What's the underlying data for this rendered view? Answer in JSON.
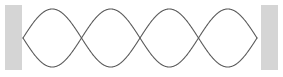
{
  "figure": {
    "name": "standing-wave-on-string-diagram",
    "width": 283,
    "height": 77,
    "background_color": "#ffffff"
  },
  "chart_data": {
    "type": "line",
    "title": "",
    "subtitle": "",
    "xlabel": "",
    "ylabel": "",
    "xlim": [
      23,
      257
    ],
    "ylim": [
      9,
      67
    ],
    "grid": false,
    "legend": false,
    "legend_position": "none",
    "harmonic_number": 4,
    "loops": 4,
    "interior_nodes": 3,
    "total_nodes": 5,
    "antinodes": 4,
    "axis_y": 38,
    "amplitude": 29,
    "string_left_x": 23,
    "string_right_x": 257,
    "wavelengths": 2,
    "node_x_positions": [
      23,
      81.5,
      140,
      198.5,
      257
    ],
    "antinode_x_positions": [
      52.25,
      110.75,
      169.25,
      227.75
    ],
    "series": [
      {
        "name": "envelope-upper",
        "phase": "positive",
        "stroke_color": "#5b5b5b",
        "stroke_width": 1.1
      },
      {
        "name": "envelope-lower",
        "phase": "negative",
        "stroke_color": "#5b5b5b",
        "stroke_width": 1.1
      }
    ]
  },
  "walls": {
    "stroke_color": "none",
    "fill_color": "#d5d5d5",
    "left": {
      "label": "left-wall",
      "x": 5,
      "y": 5,
      "width": 17,
      "height": 65
    },
    "right": {
      "label": "right-wall",
      "x": 261,
      "y": 5,
      "width": 17,
      "height": 65
    }
  },
  "colors": {
    "wave_stroke": "#5b5b5b",
    "wall_fill": "#d5d5d5",
    "background": "#ffffff"
  }
}
